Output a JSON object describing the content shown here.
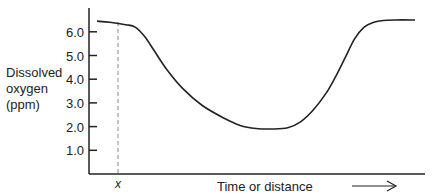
{
  "chart_data": {
    "type": "line",
    "title": "",
    "ylabel_lines": [
      "Dissolved",
      "oxygen",
      "(ppm)"
    ],
    "xlabel": "Time or distance",
    "xlabel_arrow": "long-right-arrow",
    "ylim": [
      0,
      7
    ],
    "xlim": [
      0,
      100
    ],
    "yticks": [
      1.0,
      2.0,
      3.0,
      4.0,
      5.0,
      6.0
    ],
    "ytick_labels": [
      "1.0",
      "2.0",
      "3.0",
      "4.0",
      "5.0",
      "6.0"
    ],
    "grid": false,
    "x_marker": {
      "label": "x",
      "x": 9,
      "style": "dashed"
    },
    "series": [
      {
        "name": "Dissolved oxygen",
        "x": [
          0,
          4,
          9,
          12,
          15,
          18,
          22,
          27,
          33,
          40,
          45,
          50,
          55,
          60,
          64,
          68,
          72,
          75,
          78,
          81,
          84,
          87,
          90,
          94,
          100
        ],
        "y": [
          6.45,
          6.4,
          6.3,
          6.2,
          5.8,
          5.2,
          4.4,
          3.6,
          2.9,
          2.35,
          2.05,
          1.92,
          1.9,
          1.95,
          2.2,
          2.7,
          3.4,
          4.1,
          4.9,
          5.7,
          6.2,
          6.4,
          6.48,
          6.5,
          6.5
        ]
      }
    ]
  }
}
